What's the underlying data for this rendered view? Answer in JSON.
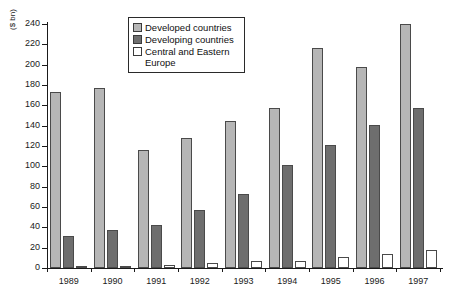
{
  "chart_data": {
    "type": "bar",
    "title": "",
    "subtitle": "",
    "xlabel": "",
    "ylabel": "($ bn)",
    "ylim": [
      0,
      240
    ],
    "ytick_step": 20,
    "yticks": [
      0,
      20,
      40,
      60,
      80,
      100,
      120,
      140,
      160,
      180,
      200,
      220,
      240
    ],
    "grid": false,
    "legend_position": "top-center",
    "categories": [
      "1989",
      "1990",
      "1991",
      "1992",
      "1993",
      "1994",
      "1995",
      "1996",
      "1997"
    ],
    "series": [
      {
        "name": "Developed countries",
        "color": "#b6b6b6",
        "values": [
          173,
          177,
          116,
          128,
          145,
          157,
          216,
          198,
          240
        ]
      },
      {
        "name": "Developing countries",
        "color": "#6e6e6e",
        "values": [
          31,
          37,
          42,
          57,
          73,
          101,
          121,
          141,
          157
        ]
      },
      {
        "name": "Central and Eastern\nEurope",
        "color": "#ffffff",
        "values": [
          1,
          1,
          3,
          5,
          7,
          7,
          11,
          14,
          18
        ]
      }
    ]
  },
  "legend": {
    "items": [
      {
        "label": "Developed countries",
        "swatch": "developed"
      },
      {
        "label": "Developing countries",
        "swatch": "developing"
      },
      {
        "label": "Central and Eastern\nEurope",
        "swatch": "cee"
      }
    ]
  },
  "axis": {
    "y_unit_label": "($ bn)"
  }
}
